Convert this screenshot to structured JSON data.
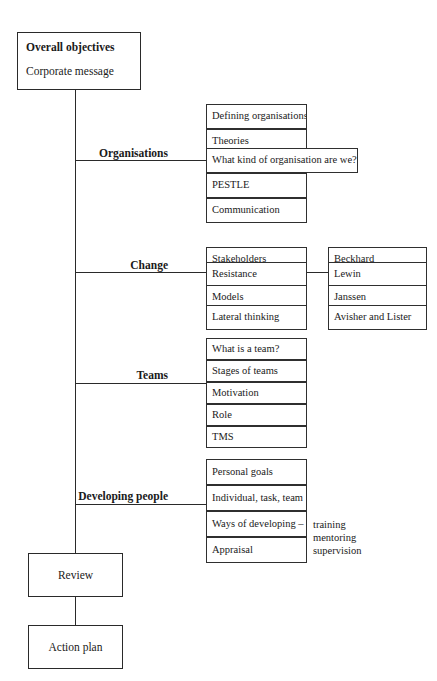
{
  "diagram": {
    "root": {
      "title": "Overall objectives",
      "subtitle": "Corporate message"
    },
    "sections": [
      {
        "label": "Organisations",
        "items": [
          "Defining organisations",
          "Theories",
          "What kind of organisation are we?",
          "PESTLE",
          "Communication"
        ]
      },
      {
        "label": "Change",
        "items": [
          "Stakeholders",
          "Resistance",
          "Models",
          "Lateral thinking"
        ],
        "items2": [
          "Beckhard",
          "Lewin",
          "Janssen",
          "Avisher and Lister"
        ]
      },
      {
        "label": "Teams",
        "items": [
          "What is a team?",
          "Stages of teams",
          "Motivation",
          "Role",
          "TMS"
        ]
      },
      {
        "label": "Developing people",
        "items": [
          "Personal goals",
          "Individual, task, team",
          "Ways of developing –",
          "Appraisal"
        ],
        "annotation": "training\nmentoring\nsupervision"
      }
    ],
    "flow": {
      "review": "Review",
      "action_plan": "Action plan"
    },
    "colors": {
      "line": "#2a2a2a",
      "text": "#1a1a1a",
      "background": "#ffffff"
    }
  }
}
